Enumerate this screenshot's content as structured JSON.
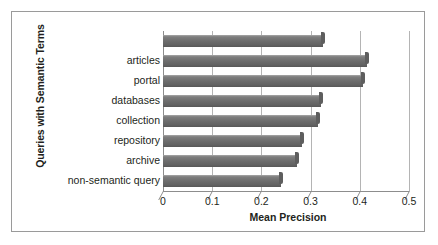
{
  "chart_data": {
    "type": "bar",
    "orientation": "horizontal",
    "title": "",
    "xlabel": "Mean Precision",
    "ylabel": "Queries with Semantic Terms",
    "xlim": [
      0,
      0.5
    ],
    "xticks": [
      "0",
      "0.1",
      "0.2",
      "0.3",
      "0.4",
      "0.5"
    ],
    "xtick_values": [
      0,
      0.1,
      0.2,
      0.3,
      0.4,
      0.5
    ],
    "grid": true,
    "legend": "none",
    "bar_color": "#6d6d6d",
    "categories": [
      "",
      "articles",
      "portal",
      "databases",
      "collection",
      "repository",
      "archive",
      "non-semantic query"
    ],
    "values": [
      0.326,
      0.415,
      0.406,
      0.322,
      0.315,
      0.283,
      0.272,
      0.24
    ]
  },
  "axes": {
    "y_title": "Queries with Semantic Terms",
    "x_title": "Mean Precision"
  },
  "category_labels": [
    "",
    "articles",
    "portal",
    "databases",
    "collection",
    "repository",
    "archive",
    "non-semantic query"
  ],
  "x_tick_labels": [
    "0",
    "0.1",
    "0.2",
    "0.3",
    "0.4",
    "0.5"
  ],
  "colors": {
    "bar": "#6d6d6d",
    "gridline": "#b4b4b4",
    "axis": "#8d8d8d",
    "border": "#9a9a9a",
    "text": "#231f20"
  }
}
